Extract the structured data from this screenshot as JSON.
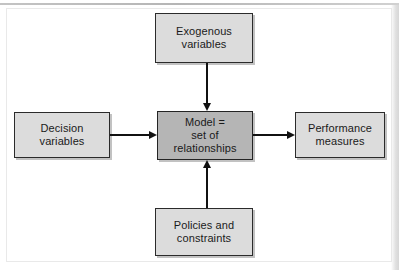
{
  "figure": {
    "type": "block-flow-diagram",
    "background_color": "#ffffff",
    "box_fill_color": "#dcdcdc",
    "center_box_fill_color": "#b5b5b5",
    "line_color": "#111111"
  },
  "nodes": {
    "exogenous": {
      "label": "Exogenous\nvariables",
      "position": "top"
    },
    "decision": {
      "label": "Decision\nvariables",
      "position": "left"
    },
    "model": {
      "label": "Model =\nset of\nrelationships",
      "position": "center"
    },
    "performance": {
      "label": "Performance\nmeasures",
      "position": "right"
    },
    "policies": {
      "label": "Policies and\nconstraints",
      "position": "bottom"
    }
  },
  "arrows": [
    {
      "name": "exogenous-to-model",
      "from": "exogenous",
      "to": "model",
      "direction": "down"
    },
    {
      "name": "decision-to-model",
      "from": "decision",
      "to": "model",
      "direction": "right"
    },
    {
      "name": "policies-to-model",
      "from": "policies",
      "to": "model",
      "direction": "up"
    },
    {
      "name": "model-to-performance",
      "from": "model",
      "to": "performance",
      "direction": "right"
    }
  ]
}
